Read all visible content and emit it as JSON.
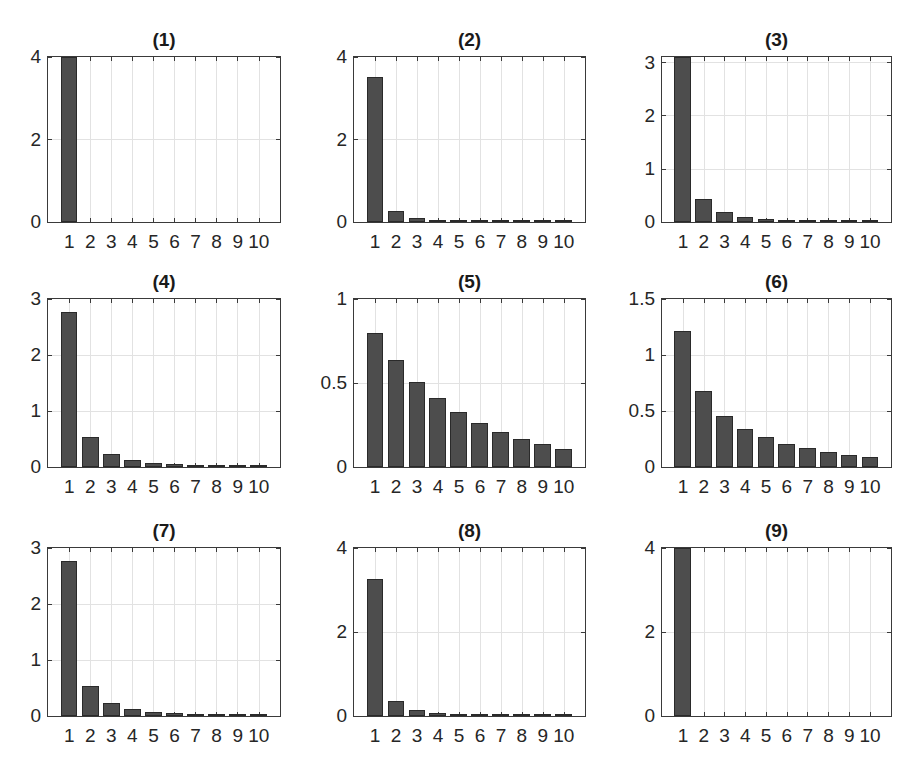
{
  "figure": {
    "background": "#ffffff",
    "bar_color": "#4d4d4d",
    "grid_color": "#e2e2e2"
  },
  "chart_data": [
    {
      "type": "bar",
      "title": "(1)",
      "categories": [
        "1",
        "2",
        "3",
        "4",
        "5",
        "6",
        "7",
        "8",
        "9",
        "10"
      ],
      "values": [
        4.0,
        0,
        0,
        0,
        0,
        0,
        0,
        0,
        0,
        0
      ],
      "ylim": [
        0,
        4
      ],
      "yticks": [
        "0",
        "2",
        "4"
      ],
      "ytick_values": [
        0,
        2,
        4
      ],
      "grid": true,
      "xlabel": "",
      "ylabel": ""
    },
    {
      "type": "bar",
      "title": "(2)",
      "categories": [
        "1",
        "2",
        "3",
        "4",
        "5",
        "6",
        "7",
        "8",
        "9",
        "10"
      ],
      "values": [
        3.52,
        0.27,
        0.1,
        0.05,
        0.03,
        0.02,
        0.015,
        0.01,
        0.008,
        0.006
      ],
      "ylim": [
        0,
        4
      ],
      "yticks": [
        "0",
        "2",
        "4"
      ],
      "ytick_values": [
        0,
        2,
        4
      ],
      "grid": true,
      "xlabel": "",
      "ylabel": ""
    },
    {
      "type": "bar",
      "title": "(3)",
      "categories": [
        "1",
        "2",
        "3",
        "4",
        "5",
        "6",
        "7",
        "8",
        "9",
        "10"
      ],
      "values": [
        3.1,
        0.43,
        0.18,
        0.1,
        0.065,
        0.045,
        0.033,
        0.025,
        0.019,
        0.015
      ],
      "ylim": [
        0,
        3.1
      ],
      "yticks": [
        "0",
        "1",
        "2",
        "3"
      ],
      "ytick_values": [
        0,
        1,
        2,
        3
      ],
      "grid": true,
      "xlabel": "",
      "ylabel": ""
    },
    {
      "type": "bar",
      "title": "(4)",
      "categories": [
        "1",
        "2",
        "3",
        "4",
        "5",
        "6",
        "7",
        "8",
        "9",
        "10"
      ],
      "values": [
        2.78,
        0.54,
        0.23,
        0.12,
        0.08,
        0.055,
        0.04,
        0.03,
        0.022,
        0.017
      ],
      "ylim": [
        0,
        3
      ],
      "yticks": [
        "0",
        "1",
        "2",
        "3"
      ],
      "ytick_values": [
        0,
        1,
        2,
        3
      ],
      "grid": true,
      "xlabel": "",
      "ylabel": ""
    },
    {
      "type": "bar",
      "title": "(5)",
      "categories": [
        "1",
        "2",
        "3",
        "4",
        "5",
        "6",
        "7",
        "8",
        "9",
        "10"
      ],
      "values": [
        0.8,
        0.64,
        0.51,
        0.41,
        0.33,
        0.26,
        0.21,
        0.17,
        0.135,
        0.11
      ],
      "ylim": [
        0,
        1
      ],
      "yticks": [
        "0",
        "0.5",
        "1"
      ],
      "ytick_values": [
        0,
        0.5,
        1
      ],
      "grid": true,
      "xlabel": "",
      "ylabel": ""
    },
    {
      "type": "bar",
      "title": "(6)",
      "categories": [
        "1",
        "2",
        "3",
        "4",
        "5",
        "6",
        "7",
        "8",
        "9",
        "10"
      ],
      "values": [
        1.22,
        0.68,
        0.455,
        0.34,
        0.265,
        0.21,
        0.17,
        0.135,
        0.11,
        0.09
      ],
      "ylim": [
        0,
        1.5
      ],
      "yticks": [
        "0",
        "0.5",
        "1",
        "1.5"
      ],
      "ytick_values": [
        0,
        0.5,
        1,
        1.5
      ],
      "grid": true,
      "xlabel": "",
      "ylabel": ""
    },
    {
      "type": "bar",
      "title": "(7)",
      "categories": [
        "1",
        "2",
        "3",
        "4",
        "5",
        "6",
        "7",
        "8",
        "9",
        "10"
      ],
      "values": [
        2.78,
        0.54,
        0.23,
        0.12,
        0.08,
        0.055,
        0.04,
        0.03,
        0.022,
        0.017
      ],
      "ylim": [
        0,
        3
      ],
      "yticks": [
        "0",
        "1",
        "2",
        "3"
      ],
      "ytick_values": [
        0,
        1,
        2,
        3
      ],
      "grid": true,
      "xlabel": "",
      "ylabel": ""
    },
    {
      "type": "bar",
      "title": "(8)",
      "categories": [
        "1",
        "2",
        "3",
        "4",
        "5",
        "6",
        "7",
        "8",
        "9",
        "10"
      ],
      "values": [
        3.28,
        0.37,
        0.14,
        0.07,
        0.04,
        0.025,
        0.017,
        0.012,
        0.009,
        0.007
      ],
      "ylim": [
        0,
        4
      ],
      "yticks": [
        "0",
        "2",
        "4"
      ],
      "ytick_values": [
        0,
        2,
        4
      ],
      "grid": true,
      "xlabel": "",
      "ylabel": ""
    },
    {
      "type": "bar",
      "title": "(9)",
      "categories": [
        "1",
        "2",
        "3",
        "4",
        "5",
        "6",
        "7",
        "8",
        "9",
        "10"
      ],
      "values": [
        4.0,
        0,
        0,
        0,
        0,
        0,
        0,
        0,
        0,
        0
      ],
      "ylim": [
        0,
        4
      ],
      "yticks": [
        "0",
        "2",
        "4"
      ],
      "ytick_values": [
        0,
        2,
        4
      ],
      "grid": true,
      "xlabel": "",
      "ylabel": ""
    }
  ]
}
